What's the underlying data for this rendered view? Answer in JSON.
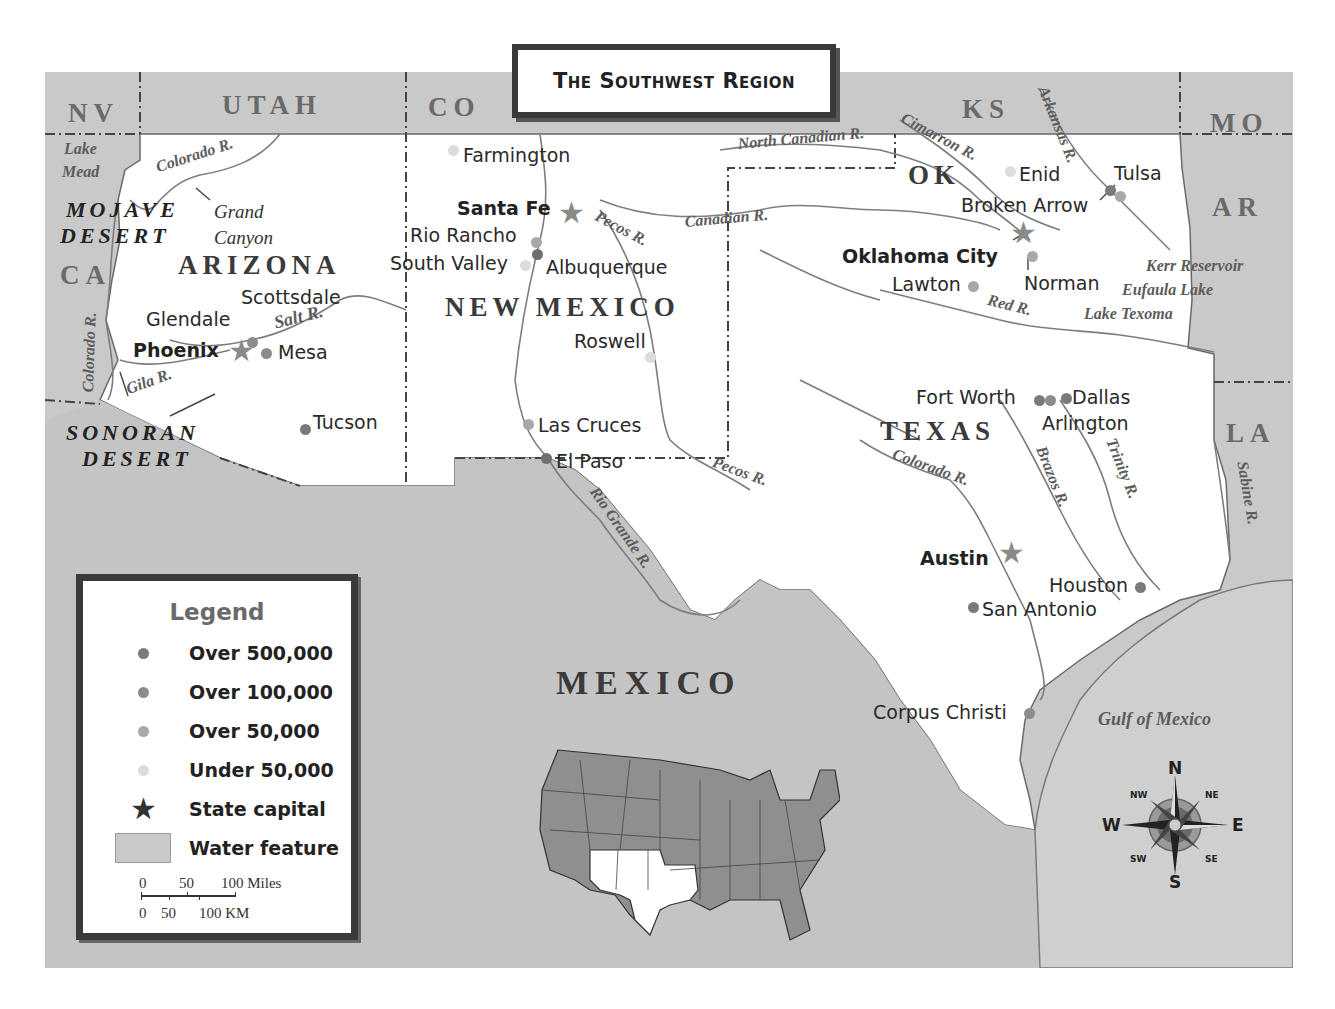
{
  "title": "The Southwest Region",
  "neighbor_states": [
    {
      "abbr": "NV",
      "x": 68,
      "y": 100
    },
    {
      "abbr": "UTAH",
      "x": 222,
      "y": 92
    },
    {
      "abbr": "CO",
      "x": 428,
      "y": 94
    },
    {
      "abbr": "KS",
      "x": 962,
      "y": 96
    },
    {
      "abbr": "MO",
      "x": 1210,
      "y": 110
    },
    {
      "abbr": "AR",
      "x": 1212,
      "y": 194
    },
    {
      "abbr": "CA",
      "x": 60,
      "y": 262
    },
    {
      "abbr": "LA",
      "x": 1226,
      "y": 420
    }
  ],
  "region_states": [
    {
      "name": "ARIZONA",
      "x": 178,
      "y": 252
    },
    {
      "name": "NEW MEXICO",
      "x": 445,
      "y": 294
    },
    {
      "name": "OK",
      "x": 908,
      "y": 162
    },
    {
      "name": "TEXAS",
      "x": 880,
      "y": 418
    }
  ],
  "country": {
    "name": "MEXICO",
    "x": 556,
    "y": 666
  },
  "deserts": [
    {
      "line1": "MOJAVE",
      "line2": "DESERT",
      "x": 60,
      "y": 198
    },
    {
      "line1": "SONORAN",
      "line2": "DESERT",
      "x": 66,
      "y": 420
    }
  ],
  "landmarks": [
    {
      "line1": "Grand",
      "line2": "Canyon",
      "x": 214,
      "y": 202
    }
  ],
  "water_features": [
    {
      "label": "Lake",
      "x": 64,
      "y": 141,
      "rotate": 0
    },
    {
      "label": "Mead",
      "x": 62,
      "y": 164,
      "rotate": 0
    },
    {
      "label": "Colorado R.",
      "x": 154,
      "y": 160,
      "rotate": -18
    },
    {
      "label": "Salt R.",
      "x": 272,
      "y": 314,
      "rotate": -14
    },
    {
      "label": "Gila R.",
      "x": 124,
      "y": 376,
      "rotate": -20
    },
    {
      "label": "Colorado R.",
      "x": 66,
      "y": 340,
      "rotate": -88
    },
    {
      "label": "Pecos R.",
      "x": 596,
      "y": 218,
      "rotate": 28
    },
    {
      "label": "Canadian R.",
      "x": 684,
      "y": 212,
      "rotate": -5
    },
    {
      "label": "North Canadian R.",
      "x": 736,
      "y": 128,
      "rotate": -5
    },
    {
      "label": "Cimarron R.",
      "x": 904,
      "y": 126,
      "rotate": 28
    },
    {
      "label": "Arkansas R.",
      "x": 1036,
      "y": 104,
      "rotate": 68
    },
    {
      "label": "Kerr Reservoir",
      "x": 1146,
      "y": 258,
      "rotate": 0
    },
    {
      "label": "Eufaula Lake",
      "x": 1122,
      "y": 282,
      "rotate": 0
    },
    {
      "label": "Lake Texoma",
      "x": 1084,
      "y": 306,
      "rotate": 0
    },
    {
      "label": "Red R.",
      "x": 988,
      "y": 296,
      "rotate": 14
    },
    {
      "label": "Pecos R.",
      "x": 714,
      "y": 462,
      "rotate": 20
    },
    {
      "label": "Rio Grande R.",
      "x": 594,
      "y": 500,
      "rotate": 55
    },
    {
      "label": "Colorado R.",
      "x": 892,
      "y": 456,
      "rotate": 20
    },
    {
      "label": "Brazos R.",
      "x": 1032,
      "y": 460,
      "rotate": 68
    },
    {
      "label": "Trinity R.",
      "x": 1104,
      "y": 450,
      "rotate": 68
    },
    {
      "label": "Sabine R.",
      "x": 1226,
      "y": 490,
      "rotate": 80
    },
    {
      "label": "Gulf of Mexico",
      "x": 1098,
      "y": 708,
      "rotate": 0
    }
  ],
  "cities": [
    {
      "name": "Farmington",
      "x": 463,
      "y": 146,
      "dot_x": 448,
      "dot_y": 145,
      "size": "under_50000",
      "capital": false
    },
    {
      "name": "Santa Fe",
      "x": 457,
      "y": 199,
      "star_x": 558,
      "star_y": 198,
      "size": "capital",
      "capital": true
    },
    {
      "name": "Rio Rancho",
      "x": 410,
      "y": 226,
      "dot_x": 531,
      "dot_y": 237,
      "size": "over_50000",
      "capital": false
    },
    {
      "name": "South Valley",
      "x": 390,
      "y": 254,
      "dot_x": 520,
      "dot_y": 260,
      "size": "under_50000",
      "capital": false
    },
    {
      "name": "Albuquerque",
      "x": 546,
      "y": 258,
      "dot_x": 532,
      "dot_y": 249,
      "size": "over_500000",
      "capital": false
    },
    {
      "name": "Scottsdale",
      "x": 241,
      "y": 288,
      "dot_x": 247,
      "dot_y": 337,
      "size": "over_100000",
      "capital": false
    },
    {
      "name": "Glendale",
      "x": 146,
      "y": 310,
      "dot_x": 236,
      "dot_y": 344,
      "size": "over_100000",
      "capital": false
    },
    {
      "name": "Phoenix",
      "x": 133,
      "y": 341,
      "star_x": 228,
      "star_y": 336,
      "size": "capital",
      "capital": true
    },
    {
      "name": "Mesa",
      "x": 278,
      "y": 343,
      "dot_x": 261,
      "dot_y": 348,
      "size": "over_100000",
      "capital": false
    },
    {
      "name": "Tucson",
      "x": 313,
      "y": 413,
      "dot_x": 300,
      "dot_y": 424,
      "size": "over_500000",
      "capital": false
    },
    {
      "name": "Roswell",
      "x": 574,
      "y": 332,
      "dot_x": 645,
      "dot_y": 352,
      "size": "under_50000",
      "capital": false
    },
    {
      "name": "Las Cruces",
      "x": 538,
      "y": 416,
      "dot_x": 523,
      "dot_y": 419,
      "size": "over_50000",
      "capital": false
    },
    {
      "name": "El Paso",
      "x": 556,
      "y": 452,
      "dot_x": 541,
      "dot_y": 453,
      "size": "over_500000",
      "capital": false
    },
    {
      "name": "Enid",
      "x": 1019,
      "y": 165,
      "dot_x": 1005,
      "dot_y": 166,
      "size": "under_50000",
      "capital": false
    },
    {
      "name": "Tulsa",
      "x": 1114,
      "y": 164,
      "dot_x": 1105,
      "dot_y": 185,
      "size": "over_100000",
      "capital": false
    },
    {
      "name": "Broken Arrow",
      "x": 961,
      "y": 196,
      "dot_x": 1115,
      "dot_y": 191,
      "size": "over_50000",
      "capital": false
    },
    {
      "name": "Oklahoma City",
      "x": 842,
      "y": 247,
      "star_x": 1010,
      "star_y": 222,
      "size": "capital",
      "capital": true
    },
    {
      "name": "Norman",
      "x": 1024,
      "y": 274,
      "dot_x": 1027,
      "dot_y": 251,
      "size": "over_50000",
      "capital": false
    },
    {
      "name": "Lawton",
      "x": 892,
      "y": 275,
      "dot_x": 968,
      "dot_y": 281,
      "size": "over_50000",
      "capital": false
    },
    {
      "name": "Fort Worth",
      "x": 916,
      "y": 388,
      "dot_x": 1034,
      "dot_y": 395,
      "size": "over_500000",
      "capital": false
    },
    {
      "name": "Arlington",
      "x": 1042,
      "y": 414,
      "dot_x": 1045,
      "dot_y": 395,
      "size": "over_100000",
      "capital": false
    },
    {
      "name": "Dallas",
      "x": 1072,
      "y": 388,
      "dot_x": 1061,
      "dot_y": 393,
      "size": "over_500000",
      "capital": false
    },
    {
      "name": "Austin",
      "x": 920,
      "y": 549,
      "star_x": 998,
      "star_y": 540,
      "size": "capital",
      "capital": true
    },
    {
      "name": "Houston",
      "x": 1049,
      "y": 576,
      "dot_x": 1135,
      "dot_y": 582,
      "size": "over_500000",
      "capital": false
    },
    {
      "name": "San Antonio",
      "x": 982,
      "y": 600,
      "dot_x": 968,
      "dot_y": 602,
      "size": "over_500000",
      "capital": false
    },
    {
      "name": "Corpus Christi",
      "x": 873,
      "y": 703,
      "dot_x": 1024,
      "dot_y": 708,
      "size": "over_100000",
      "capital": false
    }
  ],
  "legend": {
    "title": "Legend",
    "items": [
      {
        "label": "Over 500,000",
        "symbol": "dot",
        "color": "#7a7a7a"
      },
      {
        "label": "Over 100,000",
        "symbol": "dot",
        "color": "#8c8c8c"
      },
      {
        "label": "Over 50,000",
        "symbol": "dot",
        "color": "#a8a8a8"
      },
      {
        "label": "Under 50,000",
        "symbol": "dot",
        "color": "#dcdcdc"
      },
      {
        "label": "State capital",
        "symbol": "star",
        "color": "#333333"
      },
      {
        "label": "Water feature",
        "symbol": "rect",
        "color": "#c9c9c9"
      }
    ],
    "scale": {
      "miles_ticks": [
        "0",
        "50",
        "100 Miles"
      ],
      "km_ticks": [
        "0",
        "50",
        "100 KM"
      ]
    }
  },
  "compass": {
    "n": "N",
    "s": "S",
    "e": "E",
    "w": "W",
    "ne": "NE",
    "nw": "NW",
    "se": "SE",
    "sw": "SW"
  },
  "locator_map": {
    "highlighted_states": [
      "Arizona",
      "New Mexico",
      "Oklahoma",
      "Texas"
    ]
  },
  "colors": {
    "land_region": "#ffffff",
    "land_other": "#c9c9c9",
    "water": "#c9c9c9",
    "river": "#7d7d7d",
    "border": "#444444",
    "dot_over_500000": "#7a7a7a",
    "dot_over_100000": "#8c8c8c",
    "dot_over_50000": "#a8a8a8",
    "dot_under_50000": "#dcdcdc",
    "star": "#8a8a8a"
  }
}
